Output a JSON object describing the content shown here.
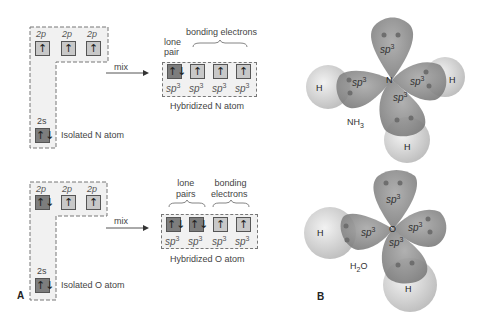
{
  "panel_a": {
    "letter": "A",
    "mix_label": "mix",
    "nitrogen": {
      "isolated": {
        "label": "Isolated N atom",
        "p_orbitals": [
          {
            "label": "2p",
            "electrons": "↑",
            "filled": false
          },
          {
            "label": "2p",
            "electrons": "↑",
            "filled": false
          },
          {
            "label": "2p",
            "electrons": "↑",
            "filled": false
          }
        ],
        "s_orbital": {
          "label": "2s",
          "electrons": "↑↓",
          "filled": true
        }
      },
      "hybridized": {
        "label": "Hybridized N atom",
        "group_labels": {
          "lone": "lone pair",
          "lone_line1": "lone",
          "lone_line2": "pair",
          "bonding": "bonding electrons"
        },
        "orbitals": [
          {
            "label": "sp",
            "sup": "3",
            "electrons": "↑↓",
            "filled": true
          },
          {
            "label": "sp",
            "sup": "3",
            "electrons": "↑",
            "filled": false
          },
          {
            "label": "sp",
            "sup": "3",
            "electrons": "↑",
            "filled": false
          },
          {
            "label": "sp",
            "sup": "3",
            "electrons": "↑",
            "filled": false
          }
        ]
      }
    },
    "oxygen": {
      "isolated": {
        "label": "Isolated O atom",
        "p_orbitals": [
          {
            "label": "2p",
            "electrons": "↑↓",
            "filled": true
          },
          {
            "label": "2p",
            "electrons": "↑",
            "filled": false
          },
          {
            "label": "2p",
            "electrons": "↑",
            "filled": false
          }
        ],
        "s_orbital": {
          "label": "2s",
          "electrons": "↑↓",
          "filled": true
        }
      },
      "hybridized": {
        "label": "Hybridized O atom",
        "group_labels": {
          "lone_line1": "lone",
          "lone_line2": "pairs",
          "bonding_line1": "bonding",
          "bonding_line2": "electrons"
        },
        "orbitals": [
          {
            "label": "sp",
            "sup": "3",
            "electrons": "↑↓",
            "filled": true
          },
          {
            "label": "sp",
            "sup": "3",
            "electrons": "↑↓",
            "filled": true
          },
          {
            "label": "sp",
            "sup": "3",
            "electrons": "↑",
            "filled": false
          },
          {
            "label": "sp",
            "sup": "3",
            "electrons": "↑",
            "filled": false
          }
        ]
      }
    }
  },
  "panel_b": {
    "letter": "B",
    "ammonia": {
      "central_atom": "N",
      "formula_main": "NH",
      "formula_sub": "3",
      "orbital_label": "sp",
      "orbital_sup": "3",
      "hydrogen_label": "H"
    },
    "water": {
      "central_atom": "O",
      "formula_h": "H",
      "formula_sub": "2",
      "formula_o": "O",
      "orbital_label": "sp",
      "orbital_sup": "3",
      "hydrogen_label": "H"
    }
  },
  "colors": {
    "filled_box": "#7d7d7d",
    "empty_box": "#c8c8c8",
    "lobe": "#8a8a8a",
    "hydrogen": "#d8d8d8"
  }
}
